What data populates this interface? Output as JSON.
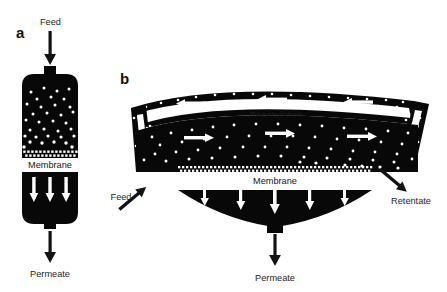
{
  "figure": {
    "background_color": "#ffffff",
    "ink_color": "#080808",
    "paper_color": "#ffffff"
  },
  "panel_a": {
    "letter": "a",
    "type": "dead-end filtration",
    "inlet_label": "Feed",
    "membrane_label": "Membrane",
    "outlet_label": "Permeate",
    "permeate_arrow_count": 3,
    "feed_arrow_direction": "down",
    "permeate_arrow_direction": "down"
  },
  "panel_b": {
    "letter": "b",
    "type": "cross-flow filtration",
    "inlet_label": "Feed",
    "recirculation_label": "Recirculation",
    "membrane_label": "Membrane",
    "retentate_label": "Retentate",
    "permeate_label": "Permeate",
    "recirculation_arrow_count": 3,
    "recirculation_arrow_direction": "left",
    "feed_channel_arrow_count": 3,
    "feed_channel_arrow_direction": "right",
    "left_riser_arrow_direction": "down",
    "right_riser_arrow_direction": "up",
    "permeate_arrow_count": 5,
    "permeate_arrow_direction": "down",
    "feed_inlet_arrow_direction": "up-right",
    "retentate_outlet_arrow_direction": "down-right"
  }
}
